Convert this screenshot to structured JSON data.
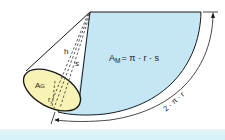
{
  "diagram": {
    "labels": {
      "lateral_area_main": "A",
      "lateral_area_sub": "M",
      "lateral_area_formula": "= π · r · s",
      "base_area_main": "A",
      "base_area_sub": "G",
      "height": "h",
      "slant_height": "s",
      "radius": "r",
      "arc_length": "2 · π · r"
    },
    "colors": {
      "sector_fill": "#c4e6f5",
      "base_fill": "#f8f3b4",
      "stroke": "#1a1a1a",
      "bottom_band": "#d9f1f9"
    }
  }
}
